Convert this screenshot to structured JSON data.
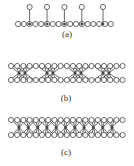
{
  "figure": {
    "panels": [
      {
        "id": "a",
        "label": "(a)",
        "label_x": 52,
        "label_y": 29
      },
      {
        "id": "b",
        "label": "(b)",
        "label_x": 51,
        "label_y": 94
      },
      {
        "id": "c",
        "label": "(c)",
        "label_x": 51,
        "label_y": 148
      }
    ],
    "colors": {
      "stroke": "#444444",
      "node_fill": "#ffffff",
      "bg": "#ffffff"
    }
  }
}
